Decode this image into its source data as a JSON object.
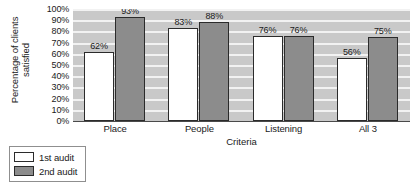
{
  "chart_data": {
    "type": "bar",
    "title": "",
    "xlabel": "Criteria",
    "ylabel": "Percentage of clients satisfied",
    "ylabel_lines": [
      "Percentage of clients",
      "satisfied"
    ],
    "categories": [
      "Place",
      "People",
      "Listening",
      "All 3"
    ],
    "series": [
      {
        "name": "1st audit",
        "color": "#ffffff",
        "values": [
          62,
          83,
          76,
          56
        ],
        "labels": [
          "62%",
          "83%",
          "76%",
          "56%"
        ]
      },
      {
        "name": "2nd audit",
        "color": "#8c8c8c",
        "values": [
          93,
          88,
          76,
          75
        ],
        "labels": [
          "93%",
          "88%",
          "76%",
          "75%"
        ]
      }
    ],
    "ylim": [
      0,
      100
    ],
    "ytick_labels": [
      "100%",
      "90%",
      "80%",
      "70%",
      "60%",
      "50%",
      "40%",
      "30%",
      "20%",
      "10%",
      "0%"
    ],
    "ytick_values": [
      100,
      90,
      80,
      70,
      60,
      50,
      40,
      30,
      20,
      10,
      0
    ],
    "grid": true,
    "grid_color": "#f2f2f2",
    "plot_background": "#c9c9c9",
    "legend_position": "below-left",
    "legend": [
      {
        "label": "1st audit",
        "color": "#ffffff"
      },
      {
        "label": "2nd audit",
        "color": "#8c8c8c"
      }
    ]
  }
}
